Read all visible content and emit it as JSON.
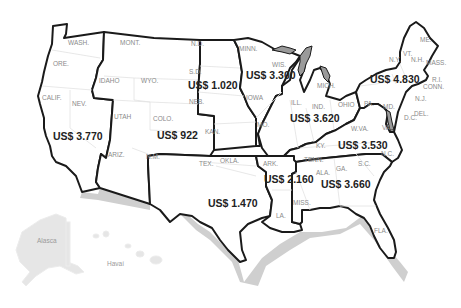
{
  "map": {
    "type": "choropleth-region-values",
    "currency_prefix": "US$",
    "regions": [
      {
        "id": "west",
        "price": "US$ 3.770",
        "states": [
          "WASH.",
          "ORE.",
          "CALIF.",
          "NEV."
        ]
      },
      {
        "id": "mountain",
        "price": "US$ 922",
        "states": [
          "MONT.",
          "IDAHO",
          "WYO.",
          "UTAH",
          "COLO.",
          "ARIZ.",
          "N.M."
        ]
      },
      {
        "id": "plains",
        "price": "US$ 1.020",
        "states": [
          "N.D.",
          "S.D.",
          "NEB.",
          "KAN."
        ]
      },
      {
        "id": "upper-midwest",
        "price": "US$ 3.300",
        "states": [
          "MINN.",
          "WIS.",
          "IOWA",
          "MO."
        ]
      },
      {
        "id": "great-lakes",
        "price": "US$ 3.620",
        "states": [
          "ILL.",
          "IND.",
          "MICH.",
          "OHIO"
        ]
      },
      {
        "id": "northeast",
        "price": "US$ 4.830",
        "states": [
          "ME.",
          "VT.",
          "N.H.",
          "N.Y.",
          "MASS.",
          "R.I.",
          "CONN.",
          "PA.",
          "N.J.",
          "MD.",
          "DEL.",
          "D.C."
        ]
      },
      {
        "id": "mid-atlantic-south",
        "price": "US$ 3.530",
        "states": [
          "W.VA.",
          "VA.",
          "KY.",
          "TENN.",
          "N.C."
        ]
      },
      {
        "id": "south-central",
        "price": "US$ 1.470",
        "states": [
          "TEX.",
          "OKLA."
        ]
      },
      {
        "id": "delta",
        "price": "US$ 2.160",
        "states": [
          "ARK.",
          "LA.",
          "MISS."
        ]
      },
      {
        "id": "southeast",
        "price": "US$ 3.660",
        "states": [
          "ALA.",
          "GA.",
          "S.C.",
          "FLA."
        ]
      }
    ],
    "territories": [
      {
        "id": "alaska",
        "label": "Alasca"
      },
      {
        "id": "hawaii",
        "label": "Havaí"
      }
    ]
  },
  "labels": {
    "wash": "WASH.",
    "ore": "ORE.",
    "calif": "CALIF.",
    "nev": "NEV.",
    "mont": "MONT.",
    "idaho": "IDAHO",
    "wyo": "WYO.",
    "utah": "UTAH",
    "colo": "COLO.",
    "ariz": "ARIZ.",
    "nm": "N.M.",
    "nd": "N.D.",
    "sd": "S.D.",
    "neb": "NEB.",
    "kan": "KAN.",
    "minn": "MINN.",
    "wis": "WIS.",
    "iowa": "IOWA",
    "mo": "MO.",
    "ill": "ILL.",
    "ind": "IND.",
    "mich": "MICH.",
    "ohio": "OHIO",
    "me": "ME.",
    "vt": "VT.",
    "nh": "N.H.",
    "ny": "N.Y.",
    "mass": "MASS.",
    "ri": "R.I.",
    "conn": "CONN.",
    "pa": "PA.",
    "nj": "N.J.",
    "md": "MD.",
    "del": "DEL.",
    "dc": "D.C.",
    "wva": "W.VA.",
    "va": "VA.",
    "ky": "KY.",
    "tenn": "TENN.",
    "nc": "N.C.",
    "tex": "TEX.",
    "okla": "OKLA.",
    "ark": "ARK.",
    "la": "LA.",
    "miss": "MISS.",
    "ala": "ALA.",
    "ga": "GA.",
    "sc": "S.C.",
    "fla": "FLA.",
    "alaska": "Alasca",
    "hawaii": "Havaí"
  },
  "prices": {
    "west": "US$ 3.770",
    "mountain": "US$ 922",
    "plains": "US$ 1.020",
    "upper_midwest": "US$ 3.300",
    "great_lakes": "US$ 3.620",
    "northeast": "US$ 4.830",
    "mid_atlantic_south": "US$ 3.530",
    "south_central": "US$ 1.470",
    "delta": "US$ 2.160",
    "southeast": "US$ 3.660"
  }
}
